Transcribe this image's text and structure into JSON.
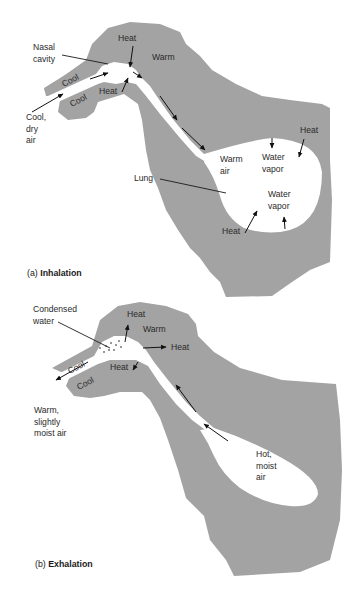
{
  "figure": {
    "colors": {
      "tissue": "#a3a3a3",
      "airway": "#ffffff",
      "text": "#2a2a2a",
      "arrow": "#111111"
    },
    "panel_a": {
      "caption_prefix": "(a) ",
      "caption_bold": "Inhalation",
      "labels": {
        "nasal_cavity": "Nasal\ncavity",
        "cool_upper": "Cool",
        "cool_lower": "Cool",
        "incoming_air": "Cool,\ndry\nair",
        "heat_top": "Heat",
        "heat_bottom": "Heat",
        "warm": "Warm",
        "warm_air": "Warm\nair",
        "water_vapor_upper": "Water\nvapor",
        "water_vapor_lower": "Water\nvapor",
        "heat_lung_right": "Heat",
        "heat_lung_bottom": "Heat",
        "lung": "Lung"
      }
    },
    "panel_b": {
      "caption_prefix": "(b) ",
      "caption_bold": "Exhalation",
      "labels": {
        "condensed_water": "Condensed\nwater",
        "heat_top": "Heat",
        "warm": "Warm",
        "heat_right": "Heat",
        "heat_bottom": "Heat",
        "cool_upper": "Cool",
        "cool_lower": "Cool",
        "outgoing_air": "Warm,\nslightly\nmoist air",
        "lung_air": "Hot,\nmoist\nair"
      }
    }
  }
}
